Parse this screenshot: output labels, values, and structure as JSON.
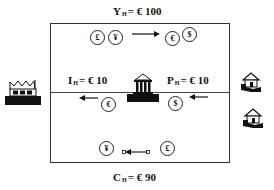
{
  "diagram": {
    "top_label": {
      "var": "Y",
      "sub": "H",
      "value": "= € 100"
    },
    "bottom_label": {
      "var": "C",
      "sub": "H",
      "value": "= € 90"
    },
    "left_flow_label": {
      "var": "I",
      "sub": "H",
      "value": "= € 10"
    },
    "right_flow_label": {
      "var": "P",
      "sub": "H",
      "value": "= € 10"
    },
    "top_flow": {
      "from_coins": [
        "£",
        "¥"
      ],
      "to_coins": [
        "€",
        "$"
      ],
      "direction": "right"
    },
    "middle_flow": {
      "coins": [
        "€",
        "$"
      ],
      "direction": "left"
    },
    "bottom_flow": {
      "from_coin": "£",
      "to_coin": "¥",
      "direction": "left"
    },
    "icons": {
      "left": "factory-icon",
      "center": "bank-icon",
      "right": [
        "house-icon",
        "house-icon"
      ]
    },
    "colors": {
      "ink": "#111111",
      "background": "#ffffff",
      "frame": "#333333"
    }
  }
}
